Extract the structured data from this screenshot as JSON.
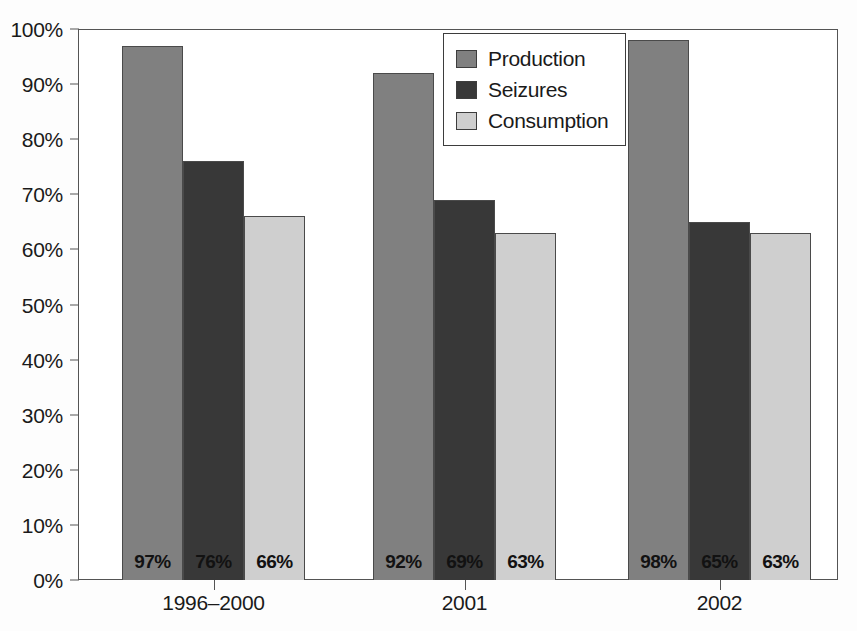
{
  "chart_data": {
    "type": "bar",
    "title": "",
    "subtitle": "",
    "xlabel": "",
    "ylabel": "",
    "categories": [
      "1996–2000",
      "2001",
      "2002"
    ],
    "series": [
      {
        "name": "Production",
        "color": "#808080",
        "values": [
          97,
          92,
          98
        ],
        "labels": [
          "97%",
          "92%",
          "98%"
        ]
      },
      {
        "name": "Seizures",
        "color": "#383838",
        "values": [
          76,
          69,
          65
        ],
        "labels": [
          "76%",
          "69%",
          "65%"
        ]
      },
      {
        "name": "Consumption",
        "color": "#cfcfcf",
        "values": [
          66,
          63,
          63
        ],
        "labels": [
          "66%",
          "63%",
          "63%"
        ]
      }
    ],
    "ylim": [
      0,
      100
    ],
    "y_ticks": [
      0,
      10,
      20,
      30,
      40,
      50,
      60,
      70,
      80,
      90,
      100
    ],
    "y_tick_labels": [
      "0%",
      "10%",
      "20%",
      "30%",
      "40%",
      "50%",
      "60%",
      "70%",
      "80%",
      "90%",
      "100%"
    ],
    "grid": false,
    "legend_position": "top-center",
    "value_labels_inside_bars": true,
    "bar_group_mode": "grouped-adjacent"
  },
  "legend": {
    "items": [
      {
        "label": "Production",
        "color": "#808080"
      },
      {
        "label": "Seizures",
        "color": "#383838"
      },
      {
        "label": "Consumption",
        "color": "#cfcfcf"
      }
    ]
  },
  "axes": {
    "y_tick_labels": [
      "100%",
      "90%",
      "80%",
      "70%",
      "60%",
      "50%",
      "40%",
      "30%",
      "20%",
      "10%",
      "0%"
    ],
    "x_tick_labels": [
      "1996–2000",
      "2001",
      "2002"
    ]
  }
}
